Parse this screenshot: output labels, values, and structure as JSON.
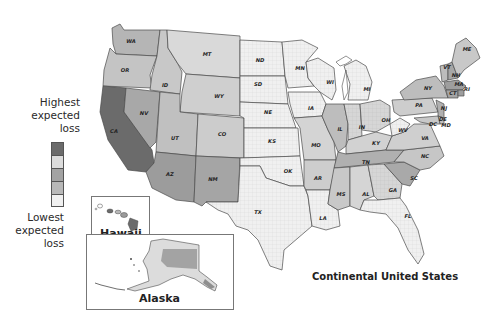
{
  "legend": {
    "high_label_lines": [
      "Highest",
      "expected",
      "loss"
    ],
    "low_label_lines": [
      "Lowest",
      "expected",
      "loss"
    ],
    "swatches": [
      {
        "level": 5,
        "color": "#6b6b6b"
      },
      {
        "level": 4,
        "color": "#dcdcdc"
      },
      {
        "level": 3,
        "color": "#a3a3a3"
      },
      {
        "level": 2,
        "color": "#b8b8b8"
      },
      {
        "level": 1,
        "color": "#f0f0f0"
      }
    ]
  },
  "captions": {
    "continental": "Continental United States",
    "hawaii": "Hawaii",
    "alaska": "Alaska"
  },
  "colors": {
    "border": "#4a4a4a",
    "lowest": "#f0f0f0",
    "low": "#d9d9d9",
    "mid": "#b5b5b5",
    "high": "#8f8f8f",
    "highest": "#6b6b6b"
  },
  "states": [
    {
      "abbr": "WA",
      "x": 131,
      "y": 43
    },
    {
      "abbr": "OR",
      "x": 125,
      "y": 72
    },
    {
      "abbr": "CA",
      "x": 114,
      "y": 133
    },
    {
      "abbr": "NV",
      "x": 144,
      "y": 115
    },
    {
      "abbr": "ID",
      "x": 165,
      "y": 87
    },
    {
      "abbr": "MT",
      "x": 207,
      "y": 56
    },
    {
      "abbr": "WY",
      "x": 219,
      "y": 98
    },
    {
      "abbr": "UT",
      "x": 175,
      "y": 140
    },
    {
      "abbr": "CO",
      "x": 222,
      "y": 136
    },
    {
      "abbr": "AZ",
      "x": 170,
      "y": 176
    },
    {
      "abbr": "NM",
      "x": 213,
      "y": 181
    },
    {
      "abbr": "ND",
      "x": 260,
      "y": 62
    },
    {
      "abbr": "SD",
      "x": 258,
      "y": 86
    },
    {
      "abbr": "NE",
      "x": 268,
      "y": 114
    },
    {
      "abbr": "KS",
      "x": 272,
      "y": 143
    },
    {
      "abbr": "OK",
      "x": 288,
      "y": 173
    },
    {
      "abbr": "TX",
      "x": 258,
      "y": 214
    },
    {
      "abbr": "MN",
      "x": 300,
      "y": 70
    },
    {
      "abbr": "IA",
      "x": 311,
      "y": 110
    },
    {
      "abbr": "MO",
      "x": 316,
      "y": 147
    },
    {
      "abbr": "AR",
      "x": 318,
      "y": 180
    },
    {
      "abbr": "LA",
      "x": 323,
      "y": 220
    },
    {
      "abbr": "WI",
      "x": 330,
      "y": 84
    },
    {
      "abbr": "IL",
      "x": 340,
      "y": 131
    },
    {
      "abbr": "MI",
      "x": 367,
      "y": 91
    },
    {
      "abbr": "IN",
      "x": 362,
      "y": 129
    },
    {
      "abbr": "OH",
      "x": 386,
      "y": 122
    },
    {
      "abbr": "KY",
      "x": 376,
      "y": 145
    },
    {
      "abbr": "TN",
      "x": 366,
      "y": 164
    },
    {
      "abbr": "MS",
      "x": 341,
      "y": 196
    },
    {
      "abbr": "AL",
      "x": 366,
      "y": 196
    },
    {
      "abbr": "GA",
      "x": 393,
      "y": 192
    },
    {
      "abbr": "FL",
      "x": 408,
      "y": 218
    },
    {
      "abbr": "SC",
      "x": 414,
      "y": 180
    },
    {
      "abbr": "NC",
      "x": 425,
      "y": 158
    },
    {
      "abbr": "VA",
      "x": 425,
      "y": 140
    },
    {
      "abbr": "WV",
      "x": 403,
      "y": 132
    },
    {
      "abbr": "PA",
      "x": 419,
      "y": 107
    },
    {
      "abbr": "NY",
      "x": 428,
      "y": 90
    },
    {
      "abbr": "VT",
      "x": 447,
      "y": 69
    },
    {
      "abbr": "NH",
      "x": 456,
      "y": 77
    },
    {
      "abbr": "ME",
      "x": 467,
      "y": 51
    },
    {
      "abbr": "MA",
      "x": 459,
      "y": 86
    },
    {
      "abbr": "RI",
      "x": 467,
      "y": 91
    },
    {
      "abbr": "CT",
      "x": 453,
      "y": 95
    },
    {
      "abbr": "NJ",
      "x": 444,
      "y": 110
    },
    {
      "abbr": "DE",
      "x": 443,
      "y": 121
    },
    {
      "abbr": "MD",
      "x": 446,
      "y": 127
    },
    {
      "abbr": "DC",
      "x": 433,
      "y": 126
    }
  ]
}
